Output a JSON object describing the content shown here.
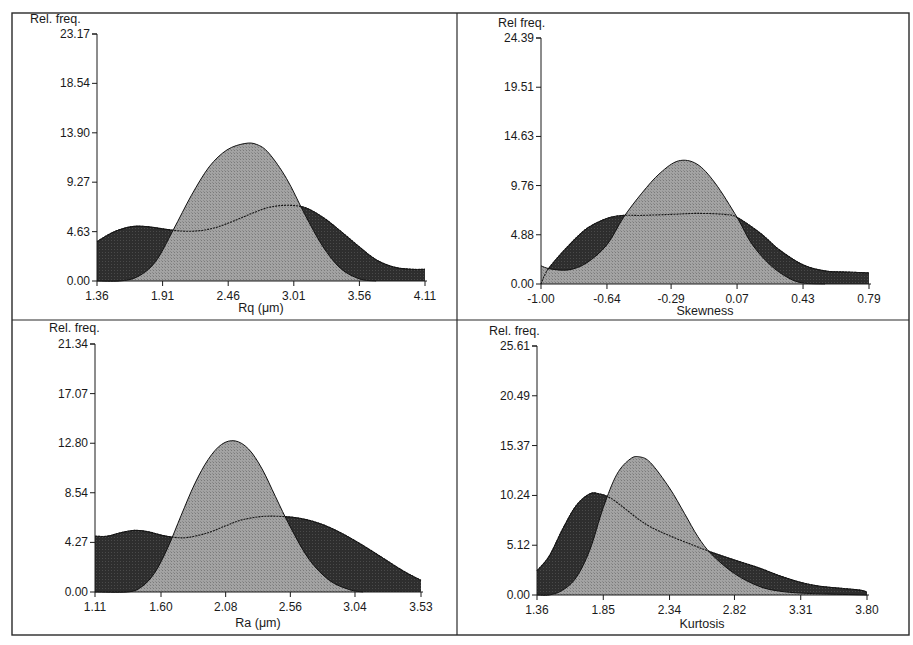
{
  "figure": {
    "background": "#ffffff",
    "frame_color": "#2a2a2a",
    "dark_fill": "#2b2b2b",
    "light_fill": "#9a9a9a"
  },
  "chart_data": [
    {
      "id": "rq",
      "type": "area",
      "title": "",
      "xlabel": "Rq (μm)",
      "ylabel": "Rel. freq.",
      "xlim": [
        1.36,
        4.11
      ],
      "ylim": [
        0.0,
        23.17
      ],
      "x_ticks": [
        "1.36",
        "1.91",
        "2.46",
        "3.01",
        "3.56",
        "4.11"
      ],
      "y_ticks": [
        "0.00",
        "4.63",
        "9.27",
        "13.90",
        "18.54",
        "23.17"
      ],
      "grid": false,
      "series": [
        {
          "name": "Broad distribution (dark)",
          "x": [
            1.36,
            1.5,
            1.65,
            1.78,
            1.91,
            2.05,
            2.2,
            2.35,
            2.5,
            2.65,
            2.8,
            2.95,
            3.1,
            3.25,
            3.4,
            3.56,
            3.7,
            3.85,
            4.0,
            4.11
          ],
          "values": [
            3.7,
            4.6,
            5.1,
            5.1,
            4.9,
            4.7,
            4.7,
            5.0,
            5.6,
            6.3,
            6.9,
            7.1,
            6.9,
            6.0,
            4.7,
            3.2,
            2.0,
            1.3,
            1.1,
            1.1
          ]
        },
        {
          "name": "Narrow distribution (light)",
          "x": [
            1.36,
            1.55,
            1.7,
            1.85,
            2.0,
            2.15,
            2.3,
            2.45,
            2.6,
            2.7,
            2.8,
            2.95,
            3.1,
            3.25,
            3.4,
            3.56,
            3.7
          ],
          "values": [
            0.0,
            0.0,
            0.4,
            1.8,
            4.8,
            8.0,
            10.7,
            12.3,
            12.9,
            12.8,
            12.0,
            9.6,
            6.3,
            3.3,
            1.2,
            0.2,
            0.0
          ]
        }
      ]
    },
    {
      "id": "skewness",
      "type": "area",
      "title": "",
      "xlabel": "Skewness",
      "ylabel": "Rel freq.",
      "xlim": [
        -1.0,
        0.79
      ],
      "ylim": [
        0.0,
        24.39
      ],
      "x_ticks": [
        "-1.00",
        "-0.64",
        "-0.29",
        "0.07",
        "0.43",
        "0.79"
      ],
      "y_ticks": [
        "0.00",
        "4.88",
        "9.76",
        "14.63",
        "19.51",
        "24.39"
      ],
      "grid": false,
      "series": [
        {
          "name": "Broad distribution (dark)",
          "x": [
            -1.0,
            -0.96,
            -0.85,
            -0.75,
            -0.64,
            -0.55,
            -0.45,
            -0.29,
            -0.15,
            0.0,
            0.07,
            0.2,
            0.3,
            0.43,
            0.55,
            0.65,
            0.79
          ],
          "values": [
            0.0,
            1.5,
            3.8,
            5.5,
            6.5,
            6.8,
            6.8,
            6.9,
            7.0,
            6.9,
            6.6,
            5.0,
            3.4,
            1.9,
            1.3,
            1.2,
            1.1
          ],
          "secondary_edge_note": "dark region also bounded below by light curve near x=-1.00"
        },
        {
          "name": "Narrow distribution (light)",
          "x": [
            -1.0,
            -0.95,
            -0.85,
            -0.75,
            -0.64,
            -0.55,
            -0.45,
            -0.35,
            -0.25,
            -0.15,
            -0.05,
            0.07,
            0.15,
            0.25,
            0.35,
            0.43,
            0.55
          ],
          "values": [
            1.8,
            1.5,
            1.4,
            2.1,
            3.9,
            6.6,
            9.0,
            11.0,
            12.2,
            11.9,
            10.0,
            6.6,
            4.0,
            1.9,
            0.6,
            0.1,
            0.0
          ]
        }
      ]
    },
    {
      "id": "ra",
      "type": "area",
      "title": "",
      "xlabel": "Ra (μm)",
      "ylabel": "Rel. freq.",
      "xlim": [
        1.11,
        3.53
      ],
      "ylim": [
        0.0,
        21.34
      ],
      "x_ticks": [
        "1.11",
        "1.60",
        "2.08",
        "2.56",
        "3.04",
        "3.53"
      ],
      "y_ticks": [
        "0.00",
        "4.27",
        "8.54",
        "12.80",
        "17.07",
        "21.34"
      ],
      "grid": false,
      "series": [
        {
          "name": "Broad distribution (dark)",
          "x": [
            1.11,
            1.2,
            1.3,
            1.4,
            1.5,
            1.6,
            1.7,
            1.8,
            1.95,
            2.08,
            2.2,
            2.35,
            2.5,
            2.65,
            2.8,
            2.95,
            3.1,
            3.25,
            3.4,
            3.53
          ],
          "values": [
            4.8,
            4.8,
            5.1,
            5.3,
            5.2,
            4.9,
            4.7,
            4.7,
            5.1,
            5.7,
            6.2,
            6.5,
            6.5,
            6.3,
            5.8,
            5.0,
            4.0,
            2.9,
            1.8,
            1.0
          ]
        },
        {
          "name": "Narrow distribution (light)",
          "x": [
            1.11,
            1.35,
            1.45,
            1.55,
            1.65,
            1.75,
            1.85,
            1.95,
            2.05,
            2.15,
            2.25,
            2.35,
            2.45,
            2.56,
            2.7,
            2.85,
            3.0,
            3.1
          ],
          "values": [
            0.0,
            0.0,
            0.4,
            1.6,
            3.8,
            6.6,
            9.3,
            11.4,
            12.7,
            13.0,
            12.3,
            10.6,
            8.2,
            5.6,
            2.8,
            1.0,
            0.2,
            0.0
          ]
        }
      ]
    },
    {
      "id": "kurtosis",
      "type": "area",
      "title": "",
      "xlabel": "Kurtosis",
      "ylabel": "Rel. freq.",
      "xlim": [
        1.36,
        3.8
      ],
      "ylim": [
        0.0,
        25.61
      ],
      "x_ticks": [
        "1.36",
        "1.85",
        "2.34",
        "2.82",
        "3.31",
        "3.80"
      ],
      "y_ticks": [
        "0.00",
        "5.12",
        "10.24",
        "15.37",
        "20.49",
        "25.61"
      ],
      "grid": false,
      "series": [
        {
          "name": "Broad distribution (dark)",
          "x": [
            1.36,
            1.45,
            1.55,
            1.65,
            1.75,
            1.82,
            1.9,
            2.0,
            2.1,
            2.2,
            2.34,
            2.5,
            2.65,
            2.82,
            3.0,
            3.15,
            3.31,
            3.45,
            3.6,
            3.75,
            3.8
          ],
          "values": [
            2.5,
            4.0,
            6.8,
            9.2,
            10.4,
            10.4,
            10.0,
            9.0,
            7.9,
            7.0,
            6.1,
            5.2,
            4.4,
            3.6,
            2.8,
            2.0,
            1.3,
            0.9,
            0.7,
            0.5,
            0.3
          ]
        },
        {
          "name": "Narrow distribution (light)",
          "x": [
            1.36,
            1.45,
            1.55,
            1.65,
            1.75,
            1.85,
            1.95,
            2.05,
            2.12,
            2.2,
            2.34,
            2.45,
            2.55,
            2.65,
            2.82,
            3.0,
            3.15,
            3.31,
            3.5,
            3.8
          ],
          "values": [
            0.0,
            0.0,
            0.5,
            1.8,
            4.6,
            9.0,
            12.4,
            14.0,
            14.2,
            13.6,
            11.0,
            8.4,
            6.0,
            4.2,
            2.2,
            0.9,
            0.4,
            0.2,
            0.1,
            0.0
          ]
        }
      ]
    }
  ]
}
